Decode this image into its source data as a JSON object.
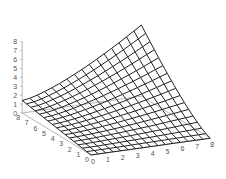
{
  "chart_data": {
    "type": "surface3d",
    "title": "",
    "xlabel": "",
    "ylabel": "",
    "zlabel": "",
    "x_ticks": [
      "0",
      "1",
      "2",
      "3",
      "4",
      "5",
      "6",
      "7",
      "8"
    ],
    "y_ticks": [
      "0",
      "1",
      "2",
      "3",
      "4",
      "5",
      "6",
      "7",
      "8"
    ],
    "z_ticks": [
      "0",
      "1",
      "2",
      "3",
      "4",
      "5",
      "6",
      "7",
      "8"
    ],
    "xlim": [
      0,
      8
    ],
    "ylim": [
      0,
      8
    ],
    "zlim": [
      0,
      8
    ],
    "grid_resolution": 16,
    "surface_function": "z = 8 * ((x/8)*(y/8))^1.3 + 1.4*(1-x/8)*(y/8)",
    "corner_values": {
      "x0_y0": 0,
      "x8_y0": 0,
      "x0_y8": 1.4,
      "x8_y8": 8
    },
    "colors": {
      "mesh": "#222222",
      "axis": "#888888",
      "labels": "#555555",
      "background": "#ffffff"
    },
    "projection": {
      "origin": [
        91,
        155
      ],
      "x_unit": [
        14.9,
        -2.1
      ],
      "y_unit": [
        -8.6,
        -5.25
      ],
      "z_unit": [
        0,
        -8.9
      ]
    }
  }
}
